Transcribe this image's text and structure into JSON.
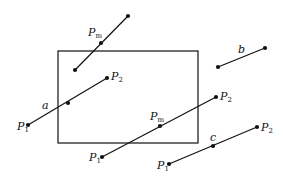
{
  "diagram": {
    "type": "line-clipping-illustration",
    "clip_window": {
      "x": 58,
      "y": 51,
      "width": 140,
      "height": 92
    },
    "segments": [
      {
        "id": "top-segment",
        "p1": [
          75,
          70
        ],
        "p2": [
          128,
          16
        ],
        "mid": [
          101,
          43
        ],
        "labels": [
          {
            "text": "P",
            "sub": "m",
            "x": 88,
            "y": 36
          }
        ]
      },
      {
        "id": "segment-a",
        "p1": [
          28,
          125
        ],
        "p2": [
          107,
          78
        ],
        "mid": [
          68,
          103
        ],
        "labels": [
          {
            "text": "a",
            "sub": "",
            "x": 42,
            "y": 109
          },
          {
            "text": "P",
            "sub": "1",
            "x": 17,
            "y": 130
          },
          {
            "text": "P",
            "sub": "2",
            "x": 111,
            "y": 80
          }
        ]
      },
      {
        "id": "segment-b",
        "p1": [
          218,
          67
        ],
        "p2": [
          265,
          48
        ],
        "mid": null,
        "labels": [
          {
            "text": "b",
            "sub": "",
            "x": 238,
            "y": 53
          }
        ]
      },
      {
        "id": "center-segment",
        "p1": [
          102,
          157
        ],
        "p2": [
          216,
          97
        ],
        "mid": [
          160,
          126
        ],
        "labels": [
          {
            "text": "P",
            "sub": "1",
            "x": 89,
            "y": 161
          },
          {
            "text": "P",
            "sub": "m",
            "x": 150,
            "y": 120
          },
          {
            "text": "P",
            "sub": "2",
            "x": 220,
            "y": 100
          }
        ]
      },
      {
        "id": "segment-c",
        "p1": [
          169,
          164
        ],
        "p2": [
          257,
          127
        ],
        "mid": [
          213,
          146
        ],
        "labels": [
          {
            "text": "c",
            "sub": "",
            "x": 210,
            "y": 141
          },
          {
            "text": "P",
            "sub": "1",
            "x": 157,
            "y": 169
          },
          {
            "text": "P",
            "sub": "2",
            "x": 261,
            "y": 131
          }
        ]
      }
    ]
  }
}
